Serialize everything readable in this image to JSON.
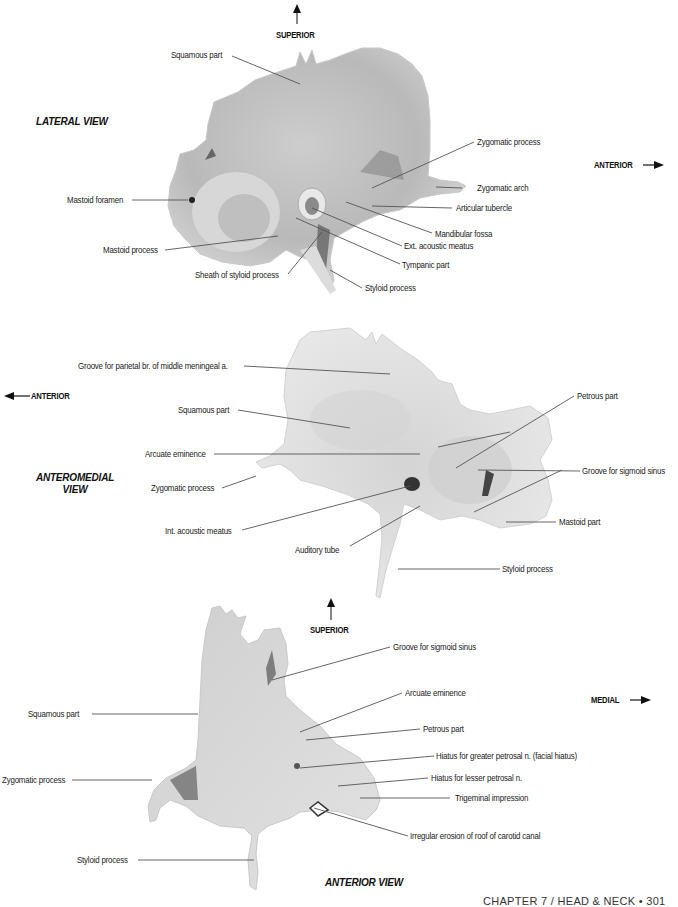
{
  "page": {
    "footer": "CHAPTER 7 / HEAD & NECK • 301"
  },
  "colors": {
    "bone_light": "#e6e6e6",
    "bone_mid": "#cfcfcf",
    "bone_dark": "#9a9a9a",
    "leader_line": "#555555",
    "text": "#222222"
  },
  "lateral_view": {
    "title": "LATERAL VIEW",
    "direction_up": "SUPERIOR",
    "direction_right": "ANTERIOR",
    "labels": [
      "Squamous part",
      "Zygomatic process",
      "Zygomatic arch",
      "Articular tubercle",
      "Mastoid foramen",
      "Mandibular fossa",
      "Ext. acoustic meatus",
      "Mastoid process",
      "Tympanic part",
      "Sheath of styloid process",
      "Styloid process"
    ]
  },
  "anteromedial_view": {
    "title_line1": "ANTEROMEDIAL",
    "title_line2": "VIEW",
    "direction_left": "ANTERIOR",
    "labels": [
      "Groove for parietal br. of middle meningeal a.",
      "Petrous part",
      "Squamous part",
      "Arcuate eminence",
      "Groove for sigmoid sinus",
      "Zygomatic process",
      "Mastoid part",
      "Int. acoustic meatus",
      "Auditory tube",
      "Styloid process"
    ]
  },
  "anterior_view": {
    "title": "ANTERIOR VIEW",
    "direction_up": "SUPERIOR",
    "direction_right": "MEDIAL",
    "labels": [
      "Groove for sigmoid sinus",
      "Arcuate eminence",
      "Squamous part",
      "Petrous part",
      "Hiatus for greater petrosal n. (facial hiatus)",
      "Hiatus for lesser petrosal n.",
      "Zygomatic process",
      "Trigeminal impression",
      "Irregular erosion of roof of carotid canal",
      "Styloid process"
    ]
  }
}
